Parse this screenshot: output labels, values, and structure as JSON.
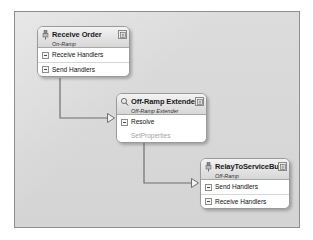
{
  "canvas": {
    "background_color": "#d8d8d8",
    "border_color": "#8e8e8e"
  },
  "diagram": {
    "type": "component-designer-canvas",
    "nodes": [
      {
        "id": "receive-order",
        "title": "Receive Order",
        "subtitle": "On-Ramp",
        "icon": "component-pin-icon",
        "collapse_button": "collapse-icon",
        "rows": [
          {
            "label": "Receive Handlers",
            "toggle": "minus-box-icon"
          },
          {
            "label": "Send Handlers",
            "toggle": "minus-box-icon"
          }
        ],
        "subrows": []
      },
      {
        "id": "offramp-extender",
        "title": "Off-Ramp Extender",
        "subtitle": "Off-Ramp Extender",
        "icon": "magnifier-icon",
        "collapse_button": "collapse-icon",
        "rows": [
          {
            "label": "Resolve",
            "toggle": "minus-box-icon"
          }
        ],
        "subrows": [
          {
            "label": "SetProperties",
            "color": "#a2a2a2"
          }
        ]
      },
      {
        "id": "relay-to-service-bus",
        "title": "RelayToServiceBu",
        "subtitle": "Off-Ramp",
        "icon": "component-pin-icon",
        "collapse_button": "collapse-icon",
        "rows": [
          {
            "label": "Send Handlers",
            "toggle": "minus-box-icon"
          },
          {
            "label": "Receive Handlers",
            "toggle": "minus-box-icon"
          }
        ],
        "subrows": []
      }
    ],
    "connectors": [
      {
        "id": "receive-order-to-offramp-extender",
        "from": "receive-order",
        "to": "offramp-extender",
        "arrowhead": "hollow-triangle",
        "color": "#6f6f6f"
      },
      {
        "id": "offramp-extender-to-relay",
        "from": "offramp-extender",
        "to": "relay-to-service-bus",
        "arrowhead": "hollow-triangle",
        "color": "#6f6f6f"
      }
    ]
  }
}
